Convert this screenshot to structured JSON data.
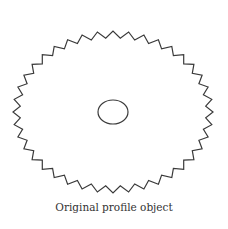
{
  "diagram": {
    "caption": "Original profile object",
    "gear": {
      "shape": "elliptical serrated profile",
      "center": [
        113,
        112
      ],
      "outer_rx": 100,
      "outer_ry": 81,
      "tooth_depth": 7,
      "teeth": 40,
      "stroke_color": "#3a3a3a"
    },
    "hole": {
      "shape": "ellipse",
      "center": [
        113,
        112
      ],
      "rx": 15,
      "ry": 12,
      "stroke_color": "#3a3a3a"
    }
  }
}
